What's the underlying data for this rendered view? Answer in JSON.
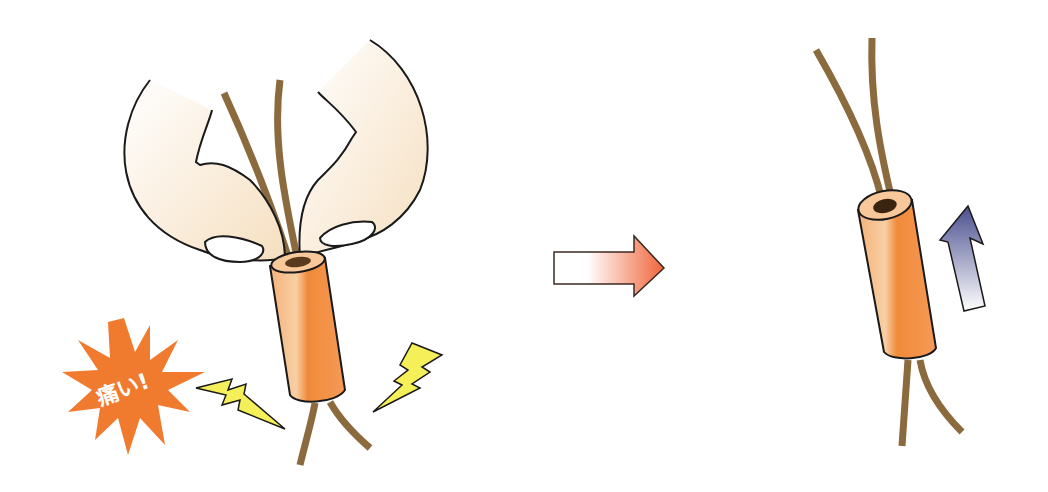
{
  "illustration": {
    "description": "Ferrite/sleeve removal: pinching with fingernails hurts; instead slide the sleeve up the wires",
    "left_panel": {
      "burst_label": "痛い!",
      "burst_color": "#f07a2e",
      "bolt_color": "#f5f05a"
    },
    "transition_arrow": {
      "direction": "right",
      "gradient": [
        "#ffffff",
        "#f0643a"
      ]
    },
    "right_panel": {
      "arrow_direction": "up",
      "arrow_gradient": [
        "#ffffff",
        "#4a4f8f"
      ]
    },
    "colors": {
      "wire": "#8b6a3e",
      "tube": "#f08a3a",
      "tube_light": "#f8c79a",
      "finger": "#f8ead6",
      "outline": "#1a1a1a"
    }
  }
}
